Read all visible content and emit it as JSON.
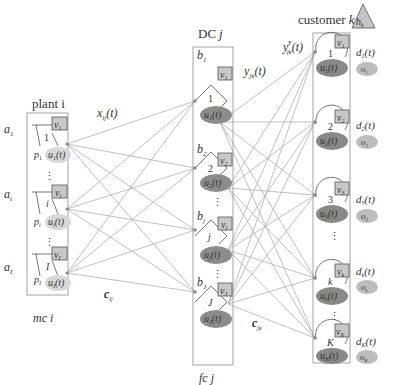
{
  "plant": {
    "title": "plant i",
    "footer": "mc i",
    "nodes": [
      {
        "index": "1",
        "v": "v",
        "v_sub": "1",
        "a": "a",
        "a_sub": "1",
        "p": "p",
        "p_sub": "1",
        "u": "u",
        "u_sub": "1",
        "u_arg": "(t)"
      },
      {
        "index": "i",
        "v": "v",
        "v_sub": "i",
        "a": "a",
        "a_sub": "i",
        "p": "p",
        "p_sub": "i",
        "u": "u",
        "u_sub": "i",
        "u_arg": "(t)"
      },
      {
        "index": "I",
        "v": "v",
        "v_sub": "I",
        "a": "a",
        "a_sub": "I",
        "p": "p",
        "p_sub": "I",
        "u": "u",
        "u_sub": "I",
        "u_arg": "(t)"
      }
    ],
    "ellipsis": "⋮"
  },
  "dc": {
    "title_main": "DC",
    "title_var": "j",
    "footer": "fc j",
    "nodes": [
      {
        "index": "1",
        "b": "b",
        "b_sub": "1",
        "v": "v",
        "v_sub": "1",
        "u": "u",
        "u_sub": "1",
        "u_arg": "(t)"
      },
      {
        "index": "2",
        "b": "b",
        "b_sub": "2",
        "v": "v",
        "v_sub": "2",
        "u": "u",
        "u_sub": "2",
        "u_arg": "(t)"
      },
      {
        "index": "j",
        "b": "b",
        "b_sub": "j",
        "v": "v",
        "v_sub": "j",
        "u": "u",
        "u_sub": "j",
        "u_arg": "(t)"
      },
      {
        "index": "J",
        "b": "b",
        "b_sub": "J",
        "v": "v",
        "v_sub": "J",
        "u": "u",
        "u_sub": "J",
        "u_arg": "(t)"
      }
    ],
    "ellipsis": "⋮"
  },
  "customer": {
    "title_main": "customer",
    "title_var": "k",
    "holding": {
      "h": "h",
      "h_sub": "k"
    },
    "nodes": [
      {
        "index": "1",
        "v": "v",
        "v_sub": "1",
        "u": "u",
        "u_sub": "1",
        "u_arg": "(t)",
        "d": "d",
        "d_sub": "1",
        "d_arg": "(t)",
        "o": "o",
        "o_sub": "1"
      },
      {
        "index": "2",
        "v": "v",
        "v_sub": "2",
        "u": "u",
        "u_sub": "2",
        "u_arg": "(t)",
        "d": "d",
        "d_sub": "2",
        "d_arg": "(t)",
        "o": "o",
        "o_sub": "2"
      },
      {
        "index": "3",
        "v": "v",
        "v_sub": "3",
        "u": "u",
        "u_sub": "3",
        "u_arg": "(t)",
        "d": "d",
        "d_sub": "3",
        "d_arg": "(t)",
        "o": "o",
        "o_sub": "3"
      },
      {
        "index": "k",
        "v": "v",
        "v_sub": "k",
        "u": "u",
        "u_sub": "k",
        "u_arg": "(t)",
        "d": "d",
        "d_sub": "k",
        "d_arg": "(t)",
        "o": "o",
        "o_sub": "k"
      },
      {
        "index": "K",
        "v": "v",
        "v_sub": "K",
        "u": "u",
        "u_sub": "K",
        "u_arg": "(t)",
        "d": "d",
        "d_sub": "K",
        "d_arg": "(t)",
        "o": "o",
        "o_sub": "K"
      }
    ],
    "ellipsis": "⋮"
  },
  "edges": {
    "x_label": {
      "var": "x",
      "sub": "ij",
      "arg": "(t)"
    },
    "y_label": {
      "var": "y",
      "sub": "jk",
      "arg": "(t)"
    },
    "yF_label": {
      "var": "y",
      "sup": "F",
      "sub": "jk",
      "arg": "(t)"
    },
    "c_ij": {
      "var": "c",
      "sub": "ij"
    },
    "c_jk": {
      "var": "c",
      "sub": "jk"
    }
  },
  "colors": {
    "line": "#a8a8a8",
    "box": "#999999",
    "v_box_fill": "#c8c8c8",
    "plant_u_fill": "#d6d6d6",
    "dc_u_fill": "#8c8c8c",
    "cust_u_fill": "#8a8a8a",
    "o_fill": "#bdbdbd",
    "triangle_fill": "#c4c4c4"
  }
}
